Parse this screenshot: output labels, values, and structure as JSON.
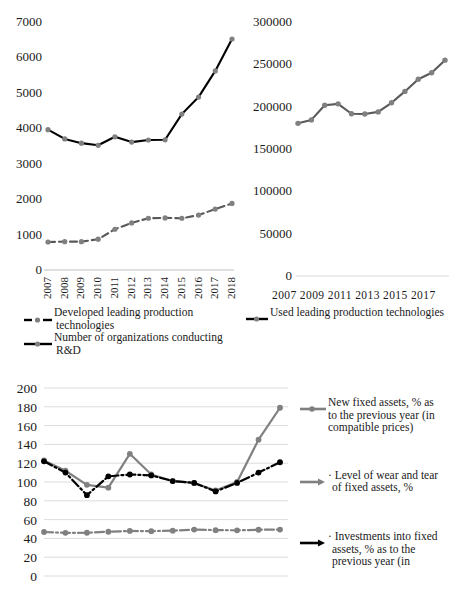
{
  "chart_data": [
    {
      "id": "technologies-left",
      "type": "line",
      "title": "",
      "xlabel": "",
      "ylabel": "",
      "categories": [
        "2007",
        "2008",
        "2009",
        "2010",
        "2011",
        "2012",
        "2013",
        "2014",
        "2015",
        "2016",
        "2017",
        "2018"
      ],
      "ylim": [
        0,
        7000
      ],
      "yticks": [
        "0",
        "1000",
        "2000",
        "3000",
        "4000",
        "5000",
        "6000",
        "7000"
      ],
      "ytick_values": [
        0,
        1000,
        2000,
        3000,
        4000,
        5000,
        6000,
        7000
      ],
      "grid": false,
      "legend_position": "bottom-left",
      "series": [
        {
          "name": "Developed leading production technologies",
          "color": "#000000",
          "marker_color": "#808080",
          "style": "solid",
          "values": [
            3960,
            3700,
            3580,
            3520,
            3760,
            3610,
            3670,
            3675,
            4400,
            4880,
            5620,
            6520
          ]
        },
        {
          "name": "Number of organizations conducting R&D",
          "color": "#595959",
          "marker_color": "#808080",
          "style": "dashed",
          "values": [
            790,
            800,
            800,
            870,
            1150,
            1330,
            1460,
            1470,
            1460,
            1550,
            1720,
            1880
          ]
        }
      ]
    },
    {
      "id": "technologies-right",
      "type": "line",
      "title": "",
      "xlabel": "",
      "ylabel": "",
      "categories": [
        "2007",
        "2008",
        "2009",
        "2010",
        "2011",
        "2012",
        "2013",
        "2014",
        "2015",
        "2016",
        "2017",
        "2018"
      ],
      "xtick_labels": [
        "2007",
        "2009",
        "2011",
        "2013",
        "2015",
        "2017"
      ],
      "ylim": [
        0,
        300000
      ],
      "yticks": [
        "0",
        "50000",
        "100000",
        "150000",
        "200000",
        "250000",
        "300000"
      ],
      "ytick_values": [
        0,
        50000,
        100000,
        150000,
        200000,
        250000,
        300000
      ],
      "grid": false,
      "legend_position": "bottom-right",
      "series": [
        {
          "name": "Used leading production technologies",
          "color": "#595959",
          "marker_color": "#808080",
          "style": "solid",
          "values": [
            180324,
            184374,
            201586,
            203330,
            191650,
            191372,
            193830,
            204546,
            218018,
            232388,
            240054,
            254927
          ]
        }
      ]
    },
    {
      "id": "fixed-assets",
      "type": "line",
      "title": "",
      "xlabel": "",
      "ylabel": "",
      "categories": [
        "2007",
        "2008",
        "2009",
        "2010",
        "2011",
        "2012",
        "2013",
        "2014",
        "2015",
        "2016",
        "2017",
        "2018"
      ],
      "ylim": [
        0,
        200
      ],
      "yticks": [
        "0",
        "20",
        "40",
        "60",
        "80",
        "100",
        "120",
        "140",
        "160",
        "180",
        "200"
      ],
      "ytick_values": [
        0,
        20,
        40,
        60,
        80,
        100,
        120,
        140,
        160,
        180,
        200
      ],
      "grid": true,
      "legend_position": "right",
      "series": [
        {
          "name": "New fixed assets, % as to the previous year (in compatible prices)",
          "color": "#808080",
          "marker_color": "#808080",
          "style": "solid",
          "values": [
            123,
            112,
            97,
            94,
            130,
            108,
            101,
            99,
            91,
            100,
            145,
            179
          ]
        },
        {
          "name": "Level of wear and tear of fixed assets, %",
          "color": "#808080",
          "marker_color": "#808080",
          "style": "dash-dot",
          "values": [
            46.8,
            45.9,
            46.0,
            47.1,
            47.9,
            47.7,
            48.2,
            49.4,
            48.8,
            48.6,
            49.2,
            49.4
          ]
        },
        {
          "name": "Investments into fixed assets, % as to the previous year (in",
          "color": "#000000",
          "marker_color": "#000000",
          "style": "dash-dot",
          "values": [
            122,
            110,
            86,
            106,
            108,
            107,
            101,
            99,
            90,
            99,
            110,
            121
          ]
        }
      ]
    }
  ],
  "top_left": {
    "yticks": [
      "7000",
      "6000",
      "5000",
      "4000",
      "3000",
      "2000",
      "1000",
      "0"
    ],
    "xticks": [
      "2007",
      "2008",
      "2009",
      "2010",
      "2011",
      "2012",
      "2013",
      "2014",
      "2015",
      "2016",
      "2017",
      "2018"
    ],
    "legend": [
      {
        "label_line1": "Developed leading production",
        "label_line2": "technologies",
        "key": "dashed-marker-key"
      },
      {
        "label_line1": "Number of organizations conducting",
        "label_line2": "R&D",
        "key": "solid-marker-key"
      }
    ]
  },
  "top_right": {
    "yticks": [
      "300000",
      "250000",
      "200000",
      "150000",
      "100000",
      "50000",
      "0"
    ],
    "xticks_joined": "2007 2009 2011 2013 2015 2017",
    "legend": [
      {
        "label": "Used leading production technologies",
        "key": "solid-marker-key"
      }
    ]
  },
  "bottom": {
    "yticks": [
      "200",
      "180",
      "160",
      "140",
      "120",
      "100",
      "80",
      "60",
      "40",
      "20",
      "0"
    ],
    "legend": [
      {
        "lines": [
          "New fixed assets, % as",
          "to the previous year (in",
          "compatible prices)"
        ],
        "key": "solid-marker-key"
      },
      {
        "lines": [
          "· Level of wear and tear",
          "of fixed assets, %"
        ],
        "key": "dashdot-marker-key"
      },
      {
        "lines": [
          "· Investments into fixed",
          "assets, % as to the",
          "previous year (in"
        ],
        "key": "arrow-black-key"
      }
    ]
  },
  "colors": {
    "black": "#000000",
    "gray": "#808080",
    "dark_gray": "#595959",
    "grid": "#d9d9d9",
    "text": "#1a1a1a",
    "background": "#ffffff"
  }
}
